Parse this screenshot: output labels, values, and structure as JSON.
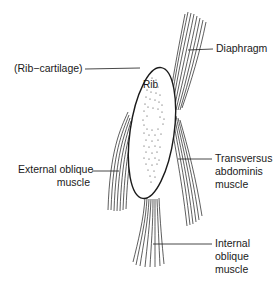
{
  "diagram": {
    "type": "anatomical-line-drawing",
    "central_structure": {
      "name": "Rib",
      "label": "Rib"
    },
    "labels": {
      "rib_cartilage": {
        "lines": [
          "(Rib−cartilage)"
        ]
      },
      "diaphragm": {
        "lines": [
          "Diaphragm"
        ]
      },
      "external_oblique": {
        "lines": [
          "External oblique",
          "muscle"
        ]
      },
      "transversus_abdominis": {
        "lines": [
          "Transversus",
          "abdominis",
          "muscle"
        ]
      },
      "internal_oblique": {
        "lines": [
          "Internal",
          "oblique",
          "muscle"
        ]
      }
    },
    "colors": {
      "ink": "#1a1a1a",
      "background": "#ffffff"
    }
  }
}
